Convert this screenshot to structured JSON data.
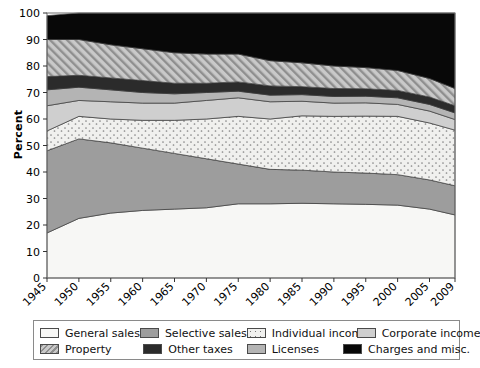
{
  "chart_data": {
    "type": "area",
    "title": "",
    "xlabel": "",
    "ylabel": "Percent",
    "ylim": [
      0,
      100
    ],
    "yticks": [
      0,
      10,
      20,
      30,
      40,
      50,
      60,
      70,
      80,
      90,
      100
    ],
    "grid": false,
    "stacked": true,
    "legend_position": "bottom",
    "x": [
      1945,
      1950,
      1955,
      1960,
      1965,
      1970,
      1975,
      1980,
      1985,
      1990,
      1995,
      2000,
      2005,
      2009
    ],
    "xtick_labels": [
      "1945",
      "1950",
      "1955",
      "1960",
      "1965",
      "1970",
      "1975",
      "1980",
      "1985",
      "1990",
      "1995",
      "2000",
      "2005",
      "2009"
    ],
    "series": [
      {
        "name": "General sales",
        "color": "#f7f7f5",
        "pattern": "solid",
        "values": [
          17.0,
          22.5,
          24.5,
          25.5,
          26.0,
          26.5,
          28.0,
          28.0,
          28.2,
          28.0,
          27.8,
          27.5,
          26.0,
          23.8
        ]
      },
      {
        "name": "Selective sales",
        "color": "#9d9d9d",
        "pattern": "solid",
        "values": [
          31.0,
          30.0,
          26.5,
          23.5,
          21.0,
          18.5,
          15.0,
          13.0,
          12.5,
          12.0,
          11.8,
          11.5,
          11.0,
          11.0
        ]
      },
      {
        "name": "Individual income",
        "color": "#efefef",
        "pattern": "dots",
        "values": [
          7.5,
          8.5,
          9.0,
          10.5,
          12.5,
          15.0,
          18.0,
          19.0,
          20.5,
          21.0,
          21.5,
          22.0,
          21.5,
          21.0
        ]
      },
      {
        "name": "Corporate income",
        "color": "#cfcfcf",
        "pattern": "solid",
        "values": [
          9.5,
          6.0,
          6.5,
          6.5,
          6.5,
          7.0,
          7.0,
          6.5,
          5.5,
          5.0,
          5.0,
          4.5,
          4.5,
          4.0
        ]
      },
      {
        "name": "Licenses",
        "color": "#b4b4b4",
        "pattern": "solid",
        "values": [
          6.0,
          5.0,
          4.5,
          4.0,
          3.5,
          3.0,
          2.5,
          2.5,
          2.5,
          2.5,
          2.5,
          2.5,
          2.5,
          2.5
        ]
      },
      {
        "name": "Other taxes",
        "color": "#2b2b2b",
        "pattern": "solid",
        "values": [
          5.0,
          4.5,
          4.5,
          4.5,
          4.0,
          3.5,
          3.5,
          3.5,
          3.0,
          3.0,
          2.8,
          2.8,
          2.8,
          2.7
        ]
      },
      {
        "name": "Property",
        "color": "#bdbdbd",
        "pattern": "diagonal-hatch",
        "values": [
          14.0,
          13.5,
          12.5,
          12.0,
          11.5,
          11.0,
          10.5,
          9.5,
          9.0,
          8.5,
          8.0,
          7.5,
          7.0,
          6.5
        ]
      },
      {
        "name": "Charges and misc.",
        "color": "#080808",
        "pattern": "solid",
        "values": [
          9.0,
          10.0,
          12.0,
          13.5,
          15.0,
          15.5,
          15.5,
          18.0,
          18.8,
          20.0,
          20.6,
          21.7,
          24.7,
          28.5
        ]
      }
    ]
  },
  "legend": {
    "items": [
      {
        "label": "General sales",
        "swatch": "general-sales-swatch"
      },
      {
        "label": "Selective sales",
        "swatch": "selective-sales-swatch"
      },
      {
        "label": "Individual income",
        "swatch": "individual-income-swatch"
      },
      {
        "label": "Corporate income",
        "swatch": "corporate-income-swatch"
      },
      {
        "label": "Property",
        "swatch": "property-swatch"
      },
      {
        "label": "Other taxes",
        "swatch": "other-taxes-swatch"
      },
      {
        "label": "Licenses",
        "swatch": "licenses-swatch"
      },
      {
        "label": "Charges and misc.",
        "swatch": "charges-and-misc-swatch"
      }
    ]
  }
}
